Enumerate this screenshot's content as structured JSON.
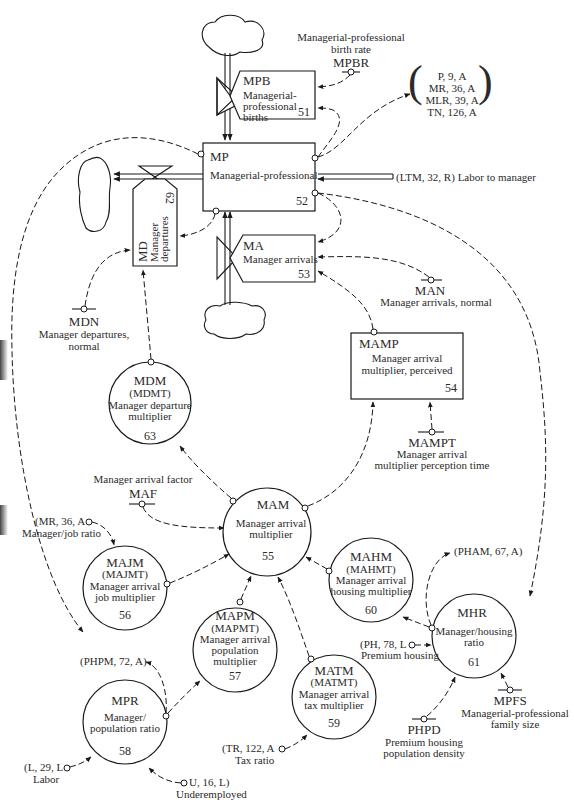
{
  "levels": {
    "mp": {
      "code": "MP",
      "label": "Managerial-professional",
      "num": "52"
    }
  },
  "rates": {
    "mpb": {
      "code": "MPB",
      "label": [
        "Managerial-",
        "professional",
        "births"
      ],
      "num": "51"
    },
    "ma": {
      "code": "MA",
      "label": "Manager arrivals",
      "num": "53"
    },
    "md": {
      "code": "MD",
      "label": [
        "Manager",
        "departures"
      ],
      "num": "62"
    }
  },
  "auxiliaries": {
    "mamp": {
      "code": "MAMP",
      "label": [
        "Manager arrival",
        "multiplier, perceived"
      ],
      "num": "54"
    },
    "mam": {
      "code": "MAM",
      "label": [
        "Manager arrival",
        "multiplier"
      ],
      "num": "55"
    },
    "majm": {
      "code": "MAJM",
      "table": "(MAJMT)",
      "label": [
        "Manager arrival",
        "job multiplier"
      ],
      "num": "56"
    },
    "mapm": {
      "code": "MAPM",
      "table": "(MAPMT)",
      "label": [
        "Manager arrival",
        "population",
        "multiplier"
      ],
      "num": "57"
    },
    "mpr": {
      "code": "MPR",
      "label": [
        "Manager/",
        "population ratio"
      ],
      "num": "58"
    },
    "matm": {
      "code": "MATM",
      "table": "(MATMT)",
      "label": [
        "Manager arrival",
        "tax multiplier"
      ],
      "num": "59"
    },
    "mahm": {
      "code": "MAHM",
      "table": "(MAHMT)",
      "label": [
        "Manager arrival",
        "housing multiplier"
      ],
      "num": "60"
    },
    "mhr": {
      "code": "MHR",
      "label": [
        "Manager/housing",
        "ratio"
      ],
      "num": "61"
    },
    "mdm": {
      "code": "MDM",
      "table": "(MDMT)",
      "label": [
        "Manager departure",
        "multiplier"
      ],
      "num": "63"
    }
  },
  "constants": {
    "mpbr": {
      "code": "MPBR",
      "label": [
        "Managerial-professional",
        "birth rate"
      ]
    },
    "man": {
      "code": "MAN",
      "label": [
        "Manager arrivals, normal"
      ]
    },
    "mdn": {
      "code": "MDN",
      "label": [
        "Manager departures,",
        "normal"
      ]
    },
    "mampt": {
      "code": "MAMPT",
      "label": [
        "Manager arrival",
        "multiplier perception time"
      ]
    },
    "maf": {
      "code": "MAF",
      "label": [
        "Manager arrival factor"
      ]
    },
    "phpd": {
      "code": "PHPD",
      "label": [
        "Premium housing",
        "population density"
      ]
    },
    "mpfs": {
      "code": "MPFS",
      "label": [
        "Managerial-professional",
        "family size"
      ]
    }
  },
  "external_refs": {
    "outputs_bracket": [
      "P, 9, A",
      "MR, 36, A",
      "MLR, 39, A",
      "TN, 126, A"
    ],
    "ltm": {
      "ref": "(LTM, 32, R)",
      "label": "Labor to manager"
    },
    "mr": {
      "ref": "(MR, 36, A",
      "label": "Manager/job ratio"
    },
    "phpm": {
      "ref": "(PHPM, 72, A)"
    },
    "l": {
      "ref": "(L, 29, L",
      "label": "Labor"
    },
    "u": {
      "ref": "U, 16, L)",
      "label": "Underemployed"
    },
    "tr": {
      "ref": "(TR, 122, A",
      "label": "Tax ratio"
    },
    "pham": {
      "ref": "(PHAM, 67, A)"
    },
    "ph": {
      "ref": "(PH, 78, L",
      "label": "Premium housing"
    }
  }
}
